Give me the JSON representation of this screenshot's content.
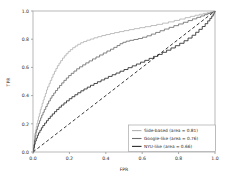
{
  "chart_data": {
    "type": "line",
    "title": "",
    "xlabel": "FPR",
    "ylabel": "TPR",
    "xlim": [
      0.0,
      1.0
    ],
    "ylim": [
      0.0,
      1.0
    ],
    "grid": false,
    "legend_position": "lower right",
    "xticks": [
      "0.0",
      "0.2",
      "0.4",
      "0.6",
      "0.8",
      "1.0"
    ],
    "xtick_values": [
      0.0,
      0.2,
      0.4,
      0.6,
      0.8,
      1.0
    ],
    "yticks": [
      "0.0",
      "0.2",
      "0.4",
      "0.6",
      "0.8",
      "1.0"
    ],
    "ytick_values": [
      0.0,
      0.2,
      0.4,
      0.6,
      0.8,
      1.0
    ],
    "series": [
      {
        "name": "Side-based (area = 0.81)",
        "color": "#b3b3b3",
        "style": "solid",
        "area": 0.81,
        "points": [
          [
            0.0,
            0.0
          ],
          [
            0.004,
            0.055
          ],
          [
            0.008,
            0.09
          ],
          [
            0.01,
            0.13
          ],
          [
            0.014,
            0.155
          ],
          [
            0.018,
            0.18
          ],
          [
            0.022,
            0.205
          ],
          [
            0.026,
            0.225
          ],
          [
            0.03,
            0.25
          ],
          [
            0.035,
            0.272
          ],
          [
            0.04,
            0.3
          ],
          [
            0.045,
            0.32
          ],
          [
            0.05,
            0.345
          ],
          [
            0.056,
            0.37
          ],
          [
            0.062,
            0.392
          ],
          [
            0.068,
            0.415
          ],
          [
            0.074,
            0.44
          ],
          [
            0.08,
            0.462
          ],
          [
            0.088,
            0.485
          ],
          [
            0.095,
            0.508
          ],
          [
            0.103,
            0.53
          ],
          [
            0.11,
            0.552
          ],
          [
            0.118,
            0.572
          ],
          [
            0.126,
            0.592
          ],
          [
            0.134,
            0.612
          ],
          [
            0.143,
            0.63
          ],
          [
            0.152,
            0.648
          ],
          [
            0.162,
            0.666
          ],
          [
            0.172,
            0.682
          ],
          [
            0.182,
            0.697
          ],
          [
            0.193,
            0.712
          ],
          [
            0.205,
            0.726
          ],
          [
            0.218,
            0.74
          ],
          [
            0.232,
            0.752
          ],
          [
            0.246,
            0.764
          ],
          [
            0.262,
            0.775
          ],
          [
            0.278,
            0.784
          ],
          [
            0.296,
            0.793
          ],
          [
            0.315,
            0.801
          ],
          [
            0.335,
            0.81
          ],
          [
            0.356,
            0.818
          ],
          [
            0.378,
            0.826
          ],
          [
            0.4,
            0.833
          ],
          [
            0.424,
            0.84
          ],
          [
            0.448,
            0.847
          ],
          [
            0.474,
            0.854
          ],
          [
            0.5,
            0.861
          ],
          [
            0.528,
            0.868
          ],
          [
            0.556,
            0.875
          ],
          [
            0.586,
            0.882
          ],
          [
            0.616,
            0.889
          ],
          [
            0.648,
            0.897
          ],
          [
            0.68,
            0.905
          ],
          [
            0.712,
            0.914
          ],
          [
            0.744,
            0.923
          ],
          [
            0.776,
            0.933
          ],
          [
            0.806,
            0.943
          ],
          [
            0.836,
            0.953
          ],
          [
            0.864,
            0.962
          ],
          [
            0.89,
            0.97
          ],
          [
            0.914,
            0.977
          ],
          [
            0.936,
            0.983
          ],
          [
            0.956,
            0.988
          ],
          [
            0.974,
            0.992
          ],
          [
            0.988,
            0.996
          ],
          [
            1.0,
            1.0
          ]
        ]
      },
      {
        "name": "Google-like (area = 0.76)",
        "color": "#6e6e6e",
        "style": "solid",
        "area": 0.76,
        "points": [
          [
            0.0,
            0.0
          ],
          [
            0.004,
            0.048
          ],
          [
            0.008,
            0.085
          ],
          [
            0.012,
            0.115
          ],
          [
            0.016,
            0.14
          ],
          [
            0.02,
            0.16
          ],
          [
            0.025,
            0.182
          ],
          [
            0.03,
            0.202
          ],
          [
            0.036,
            0.222
          ],
          [
            0.042,
            0.242
          ],
          [
            0.048,
            0.262
          ],
          [
            0.055,
            0.282
          ],
          [
            0.062,
            0.302
          ],
          [
            0.07,
            0.322
          ],
          [
            0.078,
            0.342
          ],
          [
            0.086,
            0.362
          ],
          [
            0.095,
            0.382
          ],
          [
            0.104,
            0.4
          ],
          [
            0.114,
            0.418
          ],
          [
            0.124,
            0.436
          ],
          [
            0.135,
            0.454
          ],
          [
            0.146,
            0.472
          ],
          [
            0.158,
            0.49
          ],
          [
            0.17,
            0.508
          ],
          [
            0.183,
            0.525
          ],
          [
            0.196,
            0.542
          ],
          [
            0.21,
            0.558
          ],
          [
            0.225,
            0.574
          ],
          [
            0.24,
            0.59
          ],
          [
            0.256,
            0.604
          ],
          [
            0.273,
            0.618
          ],
          [
            0.29,
            0.632
          ],
          [
            0.308,
            0.646
          ],
          [
            0.327,
            0.66
          ],
          [
            0.346,
            0.674
          ],
          [
            0.366,
            0.688
          ],
          [
            0.386,
            0.702
          ],
          [
            0.406,
            0.716
          ],
          [
            0.426,
            0.729
          ],
          [
            0.444,
            0.742
          ],
          [
            0.462,
            0.755
          ],
          [
            0.478,
            0.768
          ],
          [
            0.494,
            0.778
          ],
          [
            0.512,
            0.786
          ],
          [
            0.532,
            0.792
          ],
          [
            0.554,
            0.798
          ],
          [
            0.578,
            0.805
          ],
          [
            0.602,
            0.814
          ],
          [
            0.626,
            0.824
          ],
          [
            0.65,
            0.836
          ],
          [
            0.674,
            0.848
          ],
          [
            0.698,
            0.86
          ],
          [
            0.722,
            0.872
          ],
          [
            0.748,
            0.884
          ],
          [
            0.774,
            0.896
          ],
          [
            0.8,
            0.908
          ],
          [
            0.826,
            0.92
          ],
          [
            0.852,
            0.932
          ],
          [
            0.876,
            0.944
          ],
          [
            0.9,
            0.955
          ],
          [
            0.922,
            0.965
          ],
          [
            0.942,
            0.974
          ],
          [
            0.96,
            0.982
          ],
          [
            0.976,
            0.989
          ],
          [
            0.99,
            0.995
          ],
          [
            1.0,
            1.0
          ]
        ]
      },
      {
        "name": "NYU-like (area = 0.66)",
        "color": "#2b2b2b",
        "style": "solid",
        "area": 0.66,
        "points": [
          [
            0.0,
            0.0
          ],
          [
            0.004,
            0.03
          ],
          [
            0.008,
            0.055
          ],
          [
            0.012,
            0.078
          ],
          [
            0.018,
            0.098
          ],
          [
            0.024,
            0.118
          ],
          [
            0.03,
            0.136
          ],
          [
            0.038,
            0.154
          ],
          [
            0.046,
            0.172
          ],
          [
            0.054,
            0.188
          ],
          [
            0.064,
            0.205
          ],
          [
            0.074,
            0.222
          ],
          [
            0.084,
            0.238
          ],
          [
            0.095,
            0.254
          ],
          [
            0.106,
            0.27
          ],
          [
            0.118,
            0.286
          ],
          [
            0.13,
            0.302
          ],
          [
            0.143,
            0.318
          ],
          [
            0.156,
            0.333
          ],
          [
            0.17,
            0.348
          ],
          [
            0.184,
            0.363
          ],
          [
            0.199,
            0.378
          ],
          [
            0.214,
            0.392
          ],
          [
            0.23,
            0.406
          ],
          [
            0.246,
            0.42
          ],
          [
            0.263,
            0.434
          ],
          [
            0.28,
            0.447
          ],
          [
            0.298,
            0.46
          ],
          [
            0.316,
            0.473
          ],
          [
            0.335,
            0.486
          ],
          [
            0.354,
            0.498
          ],
          [
            0.374,
            0.511
          ],
          [
            0.394,
            0.523
          ],
          [
            0.414,
            0.536
          ],
          [
            0.435,
            0.548
          ],
          [
            0.456,
            0.56
          ],
          [
            0.478,
            0.573
          ],
          [
            0.5,
            0.585
          ],
          [
            0.522,
            0.598
          ],
          [
            0.545,
            0.611
          ],
          [
            0.568,
            0.624
          ],
          [
            0.591,
            0.637
          ],
          [
            0.614,
            0.65
          ],
          [
            0.638,
            0.664
          ],
          [
            0.662,
            0.678
          ],
          [
            0.686,
            0.692
          ],
          [
            0.71,
            0.707
          ],
          [
            0.734,
            0.722
          ],
          [
            0.758,
            0.738
          ],
          [
            0.782,
            0.754
          ],
          [
            0.806,
            0.771
          ],
          [
            0.83,
            0.789
          ],
          [
            0.852,
            0.808
          ],
          [
            0.874,
            0.828
          ],
          [
            0.894,
            0.849
          ],
          [
            0.912,
            0.87
          ],
          [
            0.93,
            0.89
          ],
          [
            0.946,
            0.91
          ],
          [
            0.96,
            0.93
          ],
          [
            0.972,
            0.948
          ],
          [
            0.982,
            0.964
          ],
          [
            0.99,
            0.978
          ],
          [
            0.996,
            0.99
          ],
          [
            1.0,
            1.0
          ]
        ]
      },
      {
        "name": "chance-diagonal",
        "color": "#151515",
        "style": "dashed",
        "points": [
          [
            0.0,
            0.0
          ],
          [
            1.0,
            1.0
          ]
        ]
      }
    ]
  },
  "legend": {
    "entries": [
      {
        "label": "Side-based (area = 0.81)",
        "color": "#b3b3b3"
      },
      {
        "label": "Google-like (area = 0.76)",
        "color": "#6e6e6e"
      },
      {
        "label": "NYU-like (area = 0.66)",
        "color": "#2b2b2b"
      }
    ]
  }
}
